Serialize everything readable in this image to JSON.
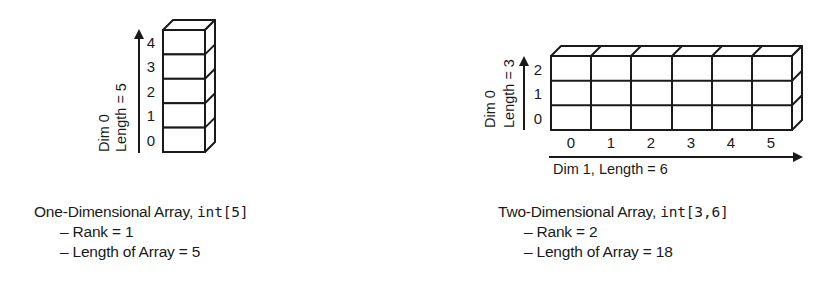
{
  "one_d": {
    "axis_label_dim": "Dim 0",
    "axis_label_length": "Length = 5",
    "indices": [
      "0",
      "1",
      "2",
      "3",
      "4"
    ],
    "caption": {
      "title": "One-Dimensional Array, ",
      "type_code": "int[5]",
      "items": [
        "– Rank = 1",
        "– Length of Array = 5"
      ]
    }
  },
  "two_d": {
    "row_axis_label_dim": "Dim 0",
    "row_axis_label_length": "Length = 3",
    "row_indices": [
      "0",
      "1",
      "2"
    ],
    "col_indices": [
      "0",
      "1",
      "2",
      "3",
      "4",
      "5"
    ],
    "col_axis_label": "Dim 1, Length = 6",
    "caption": {
      "title": "Two-Dimensional Array, ",
      "type_code": "int[3,6]",
      "items": [
        "– Rank = 2",
        "– Length of Array = 18"
      ]
    }
  },
  "colors": {
    "stroke": "#1a1a1a",
    "background": "#ffffff"
  }
}
